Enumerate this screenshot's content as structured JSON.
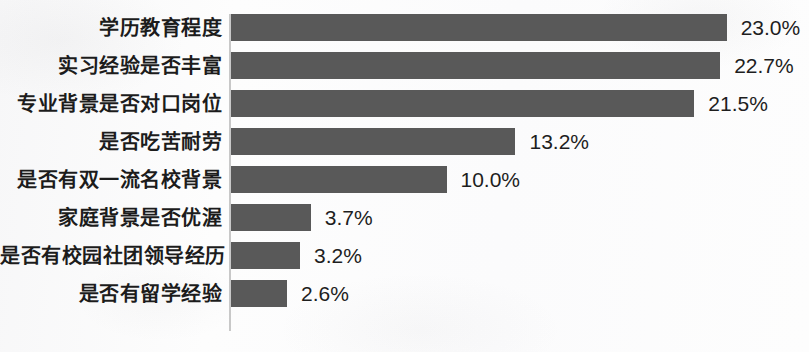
{
  "chart_data": {
    "type": "bar",
    "orientation": "horizontal",
    "title": "",
    "subtitle": "",
    "xlabel": "",
    "ylabel": "",
    "grid": false,
    "legend": null,
    "legend_position": "none",
    "axis_line": "vertical-left",
    "value_label_format": "0.0%",
    "xlim": [
      0,
      23.0
    ],
    "categories": [
      "学历教育程度",
      "实习经验是否丰富",
      "专业背景是否对口岗位",
      "是否吃苦耐劳",
      "是否有双一流名校背景",
      "家庭背景是否优渥",
      "是否有校园社团领导经历",
      "是否有留学经验"
    ],
    "values": [
      23.0,
      22.7,
      21.5,
      13.2,
      10.0,
      3.7,
      3.2,
      2.6
    ],
    "value_labels": [
      "23.0%",
      "22.7%",
      "21.5%",
      "13.2%",
      "10.0%",
      "3.7%",
      "3.2%",
      "2.6%"
    ],
    "bars": [
      {
        "category": "学历教育程度",
        "value": 23.0,
        "label": "23.0%"
      },
      {
        "category": "实习经验是否丰富",
        "value": 22.7,
        "label": "22.7%"
      },
      {
        "category": "专业背景是否对口岗位",
        "value": 21.5,
        "label": "21.5%"
      },
      {
        "category": "是否吃苦耐劳",
        "value": 13.2,
        "label": "13.2%"
      },
      {
        "category": "是否有双一流名校背景",
        "value": 10.0,
        "label": "10.0%"
      },
      {
        "category": "家庭背景是否优渥",
        "value": 3.7,
        "label": "3.7%"
      },
      {
        "category": "是否有校园社团领导经历",
        "value": 3.2,
        "label": "3.2%"
      },
      {
        "category": "是否有留学经验",
        "value": 2.6,
        "label": "2.6%"
      }
    ],
    "colors": {
      "bar": "#595959",
      "background": "#fcfcfc",
      "axis": "#c8c8c8",
      "label_text": "#1c1c1c",
      "value_text": "#1e1e1e"
    }
  }
}
